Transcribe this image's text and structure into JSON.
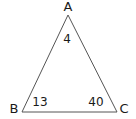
{
  "diagram": {
    "type": "triangle",
    "stroke_color": "#555555",
    "text_color": "#1a1a1a",
    "vertices": [
      {
        "name": "A",
        "x": 68,
        "y": 15
      },
      {
        "name": "B",
        "x": 22,
        "y": 112
      },
      {
        "name": "C",
        "x": 117,
        "y": 112
      }
    ],
    "vertex_labels": {
      "A": "A",
      "B": "B",
      "C": "C"
    },
    "angle_labels": {
      "A": "4",
      "B": "13",
      "C": "40"
    }
  }
}
